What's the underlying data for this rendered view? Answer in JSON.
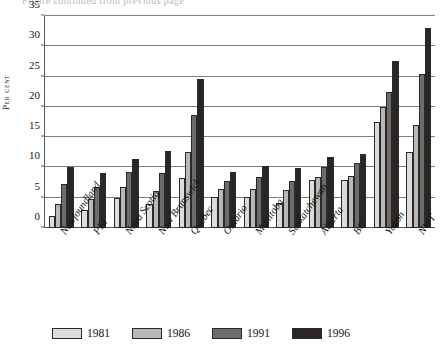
{
  "figure": {
    "top_clipped_caption": "Figure continued from previous page"
  },
  "chart_data": {
    "type": "bar",
    "title": "",
    "xlabel": "",
    "ylabel": "Per cent",
    "ylim": [
      0,
      35
    ],
    "yticks": [
      0,
      5,
      10,
      15,
      20,
      25,
      30,
      35
    ],
    "grid": true,
    "legend_position": "bottom",
    "categories": [
      "Newfoundland",
      "PEI",
      "Nova Scotia",
      "New Brunswick",
      "Quebec",
      "Ontario",
      "Manitoba",
      "Saskatchewan",
      "Alberta",
      "BC",
      "Yukon",
      "NWT"
    ],
    "series": [
      {
        "name": "1981",
        "color": "#dedcd9",
        "values": [
          2.0,
          2.9,
          5.0,
          4.0,
          8.3,
          5.1,
          5.1,
          4.2,
          7.9,
          8.0,
          17.5,
          12.5
        ]
      },
      {
        "name": "1986",
        "color": "#bab8b4",
        "values": [
          4.0,
          4.8,
          6.7,
          6.1,
          12.6,
          6.5,
          6.4,
          6.2,
          8.5,
          8.6,
          20.0,
          17.0
        ]
      },
      {
        "name": "1991",
        "color": "#6e6c69",
        "values": [
          7.3,
          6.8,
          9.3,
          9.1,
          18.7,
          7.7,
          8.5,
          7.8,
          10.1,
          10.8,
          22.5,
          25.5
        ]
      },
      {
        "name": "1996",
        "color": "#2b2523",
        "values": [
          10.0,
          9.1,
          11.4,
          12.7,
          24.6,
          9.2,
          10.3,
          9.9,
          11.8,
          12.2,
          27.5,
          33.0
        ]
      }
    ]
  }
}
